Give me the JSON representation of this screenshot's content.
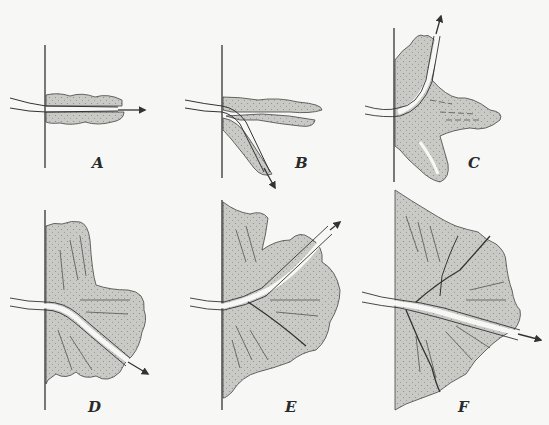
{
  "figure": {
    "type": "multi-panel-diagram",
    "panel_count": 6,
    "colors": {
      "background": "#f7f7f5",
      "fill": "#c9c9c6",
      "ink": "#333333",
      "channel": "#f7f7f5"
    },
    "panels": [
      {
        "id": "A",
        "label": "A",
        "label_x": 92,
        "label_y": 158
      },
      {
        "id": "B",
        "label": "B",
        "label_x": 295,
        "label_y": 158
      },
      {
        "id": "C",
        "label": "C",
        "label_x": 468,
        "label_y": 158
      },
      {
        "id": "D",
        "label": "D",
        "label_x": 88,
        "label_y": 400
      },
      {
        "id": "E",
        "label": "E",
        "label_x": 285,
        "label_y": 400
      },
      {
        "id": "F",
        "label": "F",
        "label_x": 458,
        "label_y": 400
      }
    ]
  }
}
